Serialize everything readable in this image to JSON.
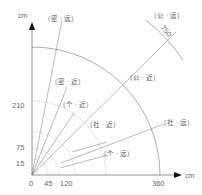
{
  "diagram": {
    "title": "",
    "axes": {
      "x_unit": "cm",
      "y_unit": "cm",
      "x_ticks": [
        "0",
        "45",
        "120",
        "360"
      ],
      "y_ticks": [
        "15",
        "75",
        "210"
      ]
    },
    "arcs": [
      {
        "radius_cm": 45,
        "style": "dotted"
      },
      {
        "radius_cm": 75,
        "style": "dotted"
      },
      {
        "radius_cm": 120,
        "style": "solid"
      },
      {
        "radius_cm": 210,
        "style": "dotted"
      },
      {
        "radius_cm": 360,
        "style": "solid"
      },
      {
        "radius_cm": 750,
        "style": "solid",
        "label": "750"
      }
    ],
    "zone_labels": [
      {
        "id": "intimate-far",
        "text": "（密 · 远）"
      },
      {
        "id": "intimate-near",
        "text": "（密 · 近）"
      },
      {
        "id": "personal-near",
        "text": "（个 · 近）"
      },
      {
        "id": "social-near",
        "text": "（社 · 近）"
      },
      {
        "id": "social-far",
        "text": "（社 · 远）"
      },
      {
        "id": "personal-far",
        "text": "（个 · 远）"
      },
      {
        "id": "public-near",
        "text": "（公 · 近）"
      },
      {
        "id": "public-far",
        "text": "（公 · 远）"
      }
    ],
    "arc_label_750": "750",
    "colors": {
      "line": "#888888",
      "axis": "#777777",
      "arrow": "#111111",
      "text": "#555555"
    }
  }
}
